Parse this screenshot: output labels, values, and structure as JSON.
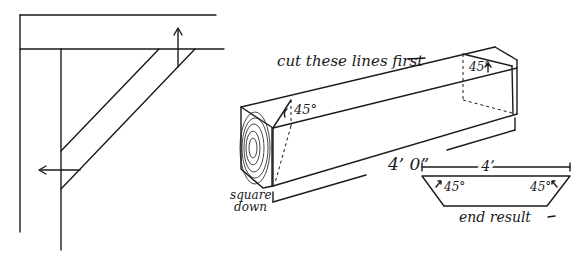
{
  "figure": {
    "left_panel": {
      "description": "Corner brace diagram with post and beam",
      "arrows": [
        "up-arrow",
        "left-arrow"
      ]
    },
    "right_panel": {
      "instruction_label": "cut these lines first",
      "angle_label_left": "45°",
      "angle_label_right": "45°",
      "length_label": "4’ 0”",
      "square_label_line1": "square",
      "square_label_line2": "down"
    },
    "end_result": {
      "width_label": "4’",
      "angle_left": "45°",
      "angle_right": "45°",
      "caption": "end result"
    }
  }
}
